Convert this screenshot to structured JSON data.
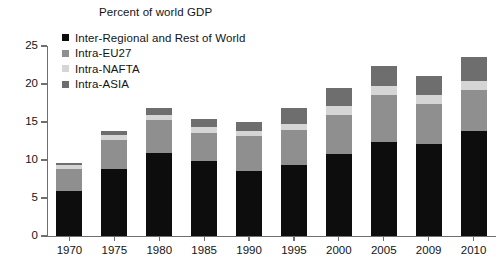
{
  "chart_data": {
    "type": "bar",
    "subtype": "stacked-vertical",
    "title": "Percent of world GDP",
    "xlabel": "",
    "ylabel": "",
    "ylim": [
      0,
      25
    ],
    "yticks": [
      0,
      5,
      10,
      15,
      20,
      25
    ],
    "grid": false,
    "legend_position": "top-left-inside",
    "categories": [
      "1970",
      "1975",
      "1980",
      "1985",
      "1990",
      "1995",
      "2000",
      "2005",
      "2009",
      "2010"
    ],
    "series": [
      {
        "name": "Inter-Regional and Rest of World",
        "color": "#0d0d0d",
        "values": [
          5.9,
          8.8,
          10.9,
          9.9,
          8.6,
          9.3,
          10.8,
          12.4,
          12.1,
          13.8
        ]
      },
      {
        "name": "Intra-EU27",
        "color": "#8f8f8f",
        "values": [
          2.9,
          3.8,
          4.4,
          3.7,
          4.6,
          4.7,
          5.1,
          6.1,
          5.3,
          5.4
        ]
      },
      {
        "name": "Intra-NAFTA",
        "color": "#d5d5d5",
        "values": [
          0.5,
          0.7,
          0.6,
          0.7,
          0.6,
          0.7,
          1.2,
          1.2,
          1.1,
          1.2
        ]
      },
      {
        "name": "Intra-ASIA",
        "color": "#6e6e6e",
        "values": [
          0.3,
          0.5,
          0.9,
          1.1,
          1.2,
          2.1,
          2.4,
          2.7,
          2.5,
          3.1
        ]
      }
    ],
    "totals": [
      9.6,
      13.8,
      16.8,
      15.4,
      15.0,
      16.8,
      19.5,
      22.4,
      21.0,
      23.5
    ]
  },
  "axis": {
    "y_tick_labels": [
      "25",
      "20",
      "15",
      "10",
      "5",
      "0"
    ],
    "x_tick_labels": [
      "1970",
      "1975",
      "1980",
      "1985",
      "1990",
      "1995",
      "2000",
      "2005",
      "2009",
      "2010"
    ]
  },
  "legend": {
    "items": [
      {
        "label": "Inter-Regional and Rest of World",
        "color": "#0d0d0d"
      },
      {
        "label": "Intra-EU27",
        "color": "#8f8f8f"
      },
      {
        "label": "Intra-NAFTA",
        "color": "#d5d5d5"
      },
      {
        "label": "Intra-ASIA",
        "color": "#6e6e6e"
      }
    ]
  },
  "colors": {
    "axis": "#6f6f6f",
    "text": "#141414",
    "background": "#ffffff"
  }
}
